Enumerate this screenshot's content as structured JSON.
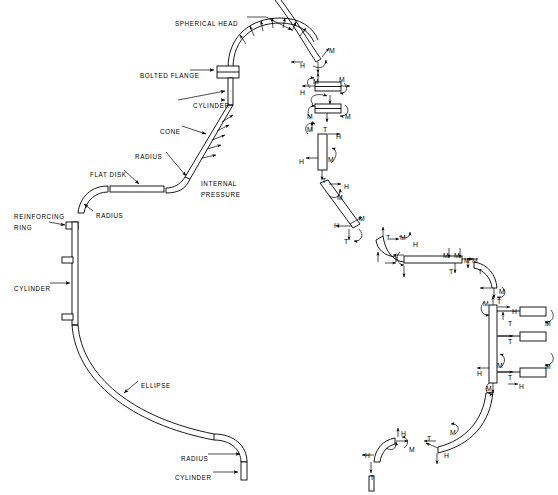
{
  "figure": {
    "background_color": "#ffffff",
    "line_color": "#000000",
    "width": 558,
    "height": 495
  },
  "assembly_labels": [
    {
      "id": "spherical-head",
      "text": "SPHERICAL HEAD",
      "x": 175,
      "y": 20
    },
    {
      "id": "bolted-flange",
      "text": "BOLTED FLANGE",
      "x": 140,
      "y": 72
    },
    {
      "id": "cylinder-upper",
      "text": "CYLINDER",
      "x": 193,
      "y": 102
    },
    {
      "id": "cone",
      "text": "CONE",
      "x": 160,
      "y": 128
    },
    {
      "id": "radius-cone",
      "text": "RADIUS",
      "x": 135,
      "y": 153
    },
    {
      "id": "flat-disk",
      "text": "FLAT DISK",
      "x": 90,
      "y": 171
    },
    {
      "id": "internal-pressure",
      "text": "INTERNAL",
      "x": 201,
      "y": 180
    },
    {
      "id": "internal-pressure-2",
      "text": "PRESSURE",
      "x": 201,
      "y": 191
    },
    {
      "id": "radius-disk",
      "text": "RADIUS",
      "x": 96,
      "y": 212
    },
    {
      "id": "reinforcing-ring",
      "text": "REINFORCING",
      "x": 14,
      "y": 213
    },
    {
      "id": "reinforcing-ring-2",
      "text": "RING",
      "x": 14,
      "y": 224
    },
    {
      "id": "cylinder-main",
      "text": "CYLINDER",
      "x": 14,
      "y": 285
    },
    {
      "id": "ellipse",
      "text": "ELLIPSE",
      "x": 141,
      "y": 382
    },
    {
      "id": "radius-lower",
      "text": "RADIUS",
      "x": 181,
      "y": 455
    },
    {
      "id": "cylinder-lower",
      "text": "CYLINDER",
      "x": 175,
      "y": 474
    }
  ],
  "load_symbols": {
    "moment": "M",
    "shear": "H",
    "tension": "T",
    "legend": [
      {
        "symbol": "M",
        "meaning": "moment"
      },
      {
        "symbol": "H",
        "meaning": "shear force"
      },
      {
        "symbol": "T",
        "meaning": "tension / longitudinal force"
      }
    ]
  },
  "load_annotations": [
    {
      "symbol": "M",
      "x": 329,
      "y": 47
    },
    {
      "symbol": "H",
      "x": 300,
      "y": 62
    },
    {
      "symbol": "M",
      "x": 313,
      "y": 78
    },
    {
      "symbol": "M",
      "x": 339,
      "y": 76
    },
    {
      "symbol": "H",
      "x": 300,
      "y": 89
    },
    {
      "symbol": "M",
      "x": 307,
      "y": 113
    },
    {
      "symbol": "M",
      "x": 345,
      "y": 113
    },
    {
      "symbol": "M",
      "x": 307,
      "y": 126
    },
    {
      "symbol": "T",
      "x": 323,
      "y": 126
    },
    {
      "symbol": "H",
      "x": 336,
      "y": 133
    },
    {
      "symbol": "H",
      "x": 299,
      "y": 158
    },
    {
      "symbol": "M",
      "x": 328,
      "y": 156
    },
    {
      "symbol": "T",
      "x": 322,
      "y": 177
    },
    {
      "symbol": "H",
      "x": 344,
      "y": 183
    },
    {
      "symbol": "M",
      "x": 337,
      "y": 194
    },
    {
      "symbol": "H",
      "x": 334,
      "y": 222
    },
    {
      "symbol": "M",
      "x": 359,
      "y": 215
    },
    {
      "symbol": "T",
      "x": 344,
      "y": 238
    },
    {
      "symbol": "T",
      "x": 386,
      "y": 234
    },
    {
      "symbol": "M",
      "x": 400,
      "y": 234
    },
    {
      "symbol": "H",
      "x": 413,
      "y": 241
    },
    {
      "symbol": "M",
      "x": 443,
      "y": 252
    },
    {
      "symbol": "M",
      "x": 454,
      "y": 252
    },
    {
      "symbol": "T",
      "x": 449,
      "y": 268
    },
    {
      "symbol": "M",
      "x": 464,
      "y": 257
    },
    {
      "symbol": "M",
      "x": 472,
      "y": 257
    },
    {
      "symbol": "T",
      "x": 478,
      "y": 268
    },
    {
      "symbol": "M",
      "x": 499,
      "y": 288
    },
    {
      "symbol": "M",
      "x": 483,
      "y": 300
    },
    {
      "symbol": "T",
      "x": 497,
      "y": 298
    },
    {
      "symbol": "H",
      "x": 512,
      "y": 308
    },
    {
      "symbol": "T",
      "x": 508,
      "y": 320
    },
    {
      "symbol": "M",
      "x": 545,
      "y": 320
    },
    {
      "symbol": "T",
      "x": 508,
      "y": 338
    },
    {
      "symbol": "H",
      "x": 477,
      "y": 370
    },
    {
      "symbol": "M",
      "x": 497,
      "y": 362
    },
    {
      "symbol": "T",
      "x": 508,
      "y": 374
    },
    {
      "symbol": "M",
      "x": 545,
      "y": 363
    },
    {
      "symbol": "M",
      "x": 486,
      "y": 385
    },
    {
      "symbol": "H",
      "x": 519,
      "y": 383
    },
    {
      "symbol": "H",
      "x": 401,
      "y": 430
    },
    {
      "symbol": "M",
      "x": 409,
      "y": 446
    },
    {
      "symbol": "T",
      "x": 427,
      "y": 435
    },
    {
      "symbol": "M",
      "x": 450,
      "y": 429
    },
    {
      "symbol": "H",
      "x": 365,
      "y": 452
    },
    {
      "symbol": "H",
      "x": 444,
      "y": 452
    },
    {
      "symbol": "T",
      "x": 370,
      "y": 474
    }
  ]
}
